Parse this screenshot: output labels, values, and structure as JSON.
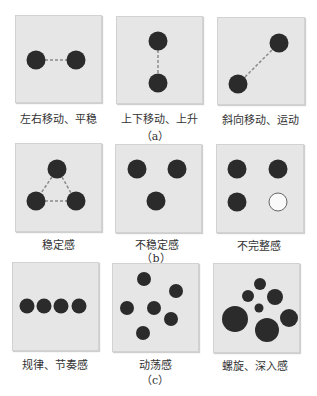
{
  "colors": {
    "dot": "#2b2b2b",
    "dash": "#8a8a8a",
    "panel": "#e6e6e6"
  },
  "groups": [
    {
      "caption": "（a）",
      "panels": [
        {
          "label": "左右移动、平稳"
        },
        {
          "label": "上下移动、上升"
        },
        {
          "label": "斜向移动、运动"
        }
      ]
    },
    {
      "caption": "（b）",
      "panels": [
        {
          "label": "稳定感"
        },
        {
          "label": "不稳定感"
        },
        {
          "label": "不完整感"
        }
      ]
    },
    {
      "caption": "（c）",
      "panels": [
        {
          "label": "规律、节奏感"
        },
        {
          "label": "动荡感"
        },
        {
          "label": "螺旋、深入感"
        }
      ]
    }
  ]
}
